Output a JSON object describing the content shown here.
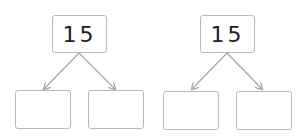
{
  "diagrams": [
    {
      "root": {
        "value": "15"
      },
      "leaves": [
        {
          "value": ""
        },
        {
          "value": ""
        }
      ]
    },
    {
      "root": {
        "value": "15"
      },
      "leaves": [
        {
          "value": ""
        },
        {
          "value": ""
        }
      ]
    }
  ],
  "colors": {
    "border": "#b9b9b9",
    "arrow": "#a8a8a8",
    "text": "#222222"
  }
}
